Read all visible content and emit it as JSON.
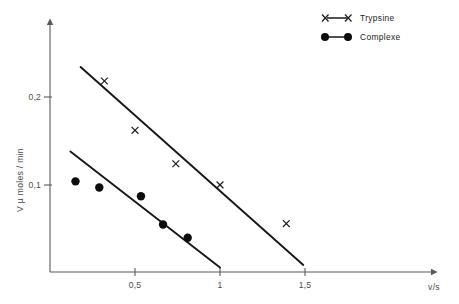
{
  "chart_data": {
    "type": "scatter",
    "title": "",
    "subtitle": "",
    "xlabel": "v/s",
    "ylabel": "V µ moles / min",
    "xlim": [
      0,
      1.72
    ],
    "ylim": [
      0,
      0.29
    ],
    "grid": false,
    "legend_position": "top-right",
    "xticks": [
      {
        "value": 0.5,
        "label": "0,5"
      },
      {
        "value": 1.0,
        "label": "1"
      },
      {
        "value": 1.5,
        "label": "1,5"
      }
    ],
    "yticks": [
      {
        "value": 0.1,
        "label": "0,1"
      },
      {
        "value": 0.2,
        "label": "0,2"
      }
    ],
    "series": [
      {
        "name": "Trypsine",
        "marker": "x",
        "color": "#18181a",
        "points": [
          {
            "x": 0.32,
            "y": 0.217
          },
          {
            "x": 0.5,
            "y": 0.161
          },
          {
            "x": 0.74,
            "y": 0.123
          },
          {
            "x": 1.0,
            "y": 0.099
          },
          {
            "x": 1.39,
            "y": 0.055
          }
        ],
        "fit_line": {
          "x1": 0.18,
          "y1": 0.233,
          "x2": 1.49,
          "y2": 0.008
        }
      },
      {
        "name": "Complexe",
        "marker": "circle",
        "color": "#0d0d0f",
        "points": [
          {
            "x": 0.15,
            "y": 0.103
          },
          {
            "x": 0.29,
            "y": 0.096
          },
          {
            "x": 0.535,
            "y": 0.086
          },
          {
            "x": 0.665,
            "y": 0.054
          },
          {
            "x": 0.81,
            "y": 0.039
          }
        ],
        "fit_line": {
          "x1": 0.12,
          "y1": 0.137,
          "x2": 1.0,
          "y2": 0.005
        }
      }
    ]
  },
  "legend": {
    "entries": [
      {
        "label": "Trypsine",
        "marker": "x"
      },
      {
        "label": "Complexe",
        "marker": "circle"
      }
    ]
  },
  "axes": {
    "x_axis_title": "v/s",
    "y_axis_title": "V µ moles / min"
  }
}
